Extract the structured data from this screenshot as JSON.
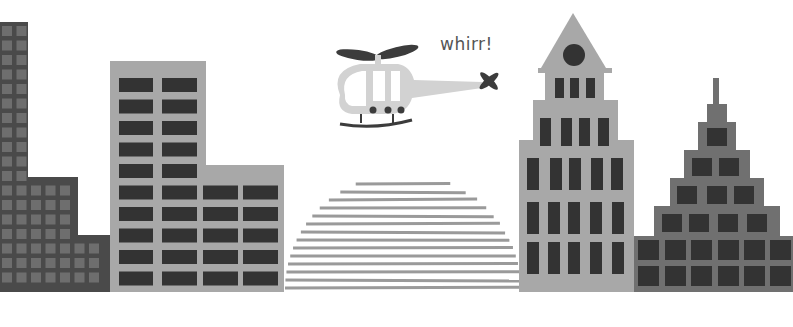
{
  "scene": {
    "description": "Stylized grayscale city skyline illustration with a helicopter",
    "caption": "whirr!",
    "colors": {
      "background": "#ffffff",
      "dark_building": "#4a4a4a",
      "dark_window": "#6e6e6e",
      "light_building": "#a8a8a8",
      "window_dark": "#333333",
      "helicopter_body": "#d2d2d2",
      "helicopter_dark": "#3c3c3c",
      "dome_stripe": "#9a9a9a",
      "pyramid_building": "#707070"
    },
    "elements": [
      {
        "name": "dark-stepped-building",
        "position": "far-left"
      },
      {
        "name": "gray-office-building",
        "position": "left"
      },
      {
        "name": "striped-dome",
        "position": "center"
      },
      {
        "name": "helicopter",
        "position": "center-top"
      },
      {
        "name": "spire-tower",
        "position": "right"
      },
      {
        "name": "stepped-pyramid-building",
        "position": "far-right"
      }
    ]
  }
}
